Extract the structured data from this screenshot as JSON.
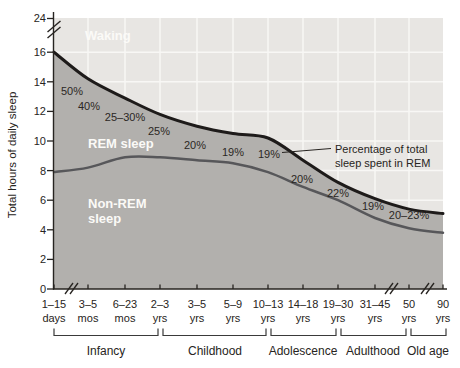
{
  "figure": {
    "y_axis": {
      "label": "Total hours of daily sleep",
      "top_tick": "24",
      "ticks": [
        "16",
        "14",
        "12",
        "10",
        "8",
        "6",
        "4",
        "2",
        "0"
      ]
    },
    "x_axis": {
      "ticks": [
        {
          "line1": "1–15",
          "line2": "days"
        },
        {
          "line1": "3–5",
          "line2": "mos"
        },
        {
          "line1": "6–23",
          "line2": "mos"
        },
        {
          "line1": "2–3",
          "line2": "yrs"
        },
        {
          "line1": "3–5",
          "line2": "yrs"
        },
        {
          "line1": "5–9",
          "line2": "yrs"
        },
        {
          "line1": "10–13",
          "line2": "yrs"
        },
        {
          "line1": "14–18",
          "line2": "yrs"
        },
        {
          "line1": "19–30",
          "line2": "yrs"
        },
        {
          "line1": "31–45",
          "line2": "yrs"
        },
        {
          "line1": "50",
          "line2": "yrs"
        },
        {
          "line1": "90",
          "line2": "yrs"
        }
      ]
    },
    "area_labels": {
      "waking": "Waking",
      "rem": "REM sleep",
      "nonrem_line1": "Non-REM",
      "nonrem_line2": "sleep"
    },
    "annotation": {
      "line1": "Percentage of total",
      "line2": "sleep spent in REM"
    },
    "colors": {
      "waking_fill": "#e8e6e3",
      "sleep_fill": "#b2b0ad",
      "gridline": "#f8f7f5",
      "total_curve": "#1e1b1a",
      "nonrem_curve": "#57575a",
      "axis": "#272421",
      "area_label_text": "#fbfaf7"
    }
  },
  "chart_data": {
    "type": "area",
    "ylabel": "Total hours of daily sleep",
    "ylim": [
      0,
      24
    ],
    "y_ticks": [
      0,
      2,
      4,
      6,
      8,
      10,
      12,
      14,
      16,
      24
    ],
    "grid": true,
    "categories": [
      "1–15 days",
      "3–5 mos",
      "6–23 mos",
      "2–3 yrs",
      "3–5 yrs",
      "5–9 yrs",
      "10–13 yrs",
      "14–18 yrs",
      "19–30 yrs",
      "31–45 yrs",
      "50 yrs",
      "90 yrs"
    ],
    "series": [
      {
        "name": "Total daily sleep (hours)",
        "values": [
          16.0,
          14.2,
          12.9,
          11.8,
          11.0,
          10.5,
          10.2,
          8.7,
          7.2,
          6.1,
          5.4,
          5.1
        ]
      },
      {
        "name": "Non-REM sleep (hours)",
        "values": [
          7.9,
          8.2,
          8.9,
          8.9,
          8.7,
          8.5,
          7.9,
          6.9,
          6.0,
          4.8,
          4.1,
          3.8
        ]
      }
    ],
    "rem_percent_labels": [
      "50%",
      "40%",
      "25–30%",
      "25%",
      "20%",
      "19%",
      "19%",
      "20%",
      "22%",
      "19%",
      "20–23%"
    ],
    "regions": {
      "waking": "above total-sleep curve",
      "rem": "between total-sleep and non-REM curves",
      "nonrem": "below non-REM curve"
    },
    "axis_breaks": {
      "y": [
        "between 16 and 24"
      ],
      "x": [
        "after 1–15 days",
        "between 31–45 yrs and 50 yrs",
        "between 50 yrs and 90 yrs"
      ]
    },
    "life_stage_groups": [
      {
        "label": "Infancy",
        "from": "1–15 days",
        "to": "2–3 yrs"
      },
      {
        "label": "Childhood",
        "from": "2–3 yrs",
        "to": "10–13 yrs"
      },
      {
        "label": "Adolescence",
        "from": "10–13 yrs",
        "to": "19–30 yrs"
      },
      {
        "label": "Adulthood",
        "from": "19–30 yrs",
        "to": "50 yrs"
      },
      {
        "label": "Old age",
        "from": "50 yrs",
        "to": "90 yrs"
      }
    ]
  }
}
